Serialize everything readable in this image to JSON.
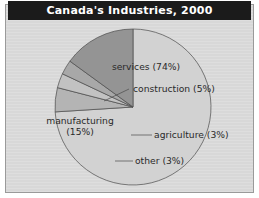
{
  "figure": {
    "title": "Canada's Industries, 2000",
    "background_color": "#d8d8d8",
    "frame_color": "#9a9a9a",
    "title_bar_color": "#1b1b1b",
    "title_text_color": "#ffffff"
  },
  "chart_data": {
    "type": "pie",
    "title": "Canada's Industries, 2000",
    "xlabel": "",
    "ylabel": "",
    "legend": "none",
    "grid": false,
    "start_angle_deg": 90,
    "direction": "counterclockwise",
    "center": {
      "x": 133,
      "y": 107
    },
    "radius": 78,
    "categories": [
      "services",
      "construction",
      "agriculture",
      "other",
      "manufacturing"
    ],
    "values": [
      74,
      5,
      3,
      3,
      15
    ],
    "labels": [
      "services (74%)",
      "construction (5%)",
      "agriculture (3%)",
      "other (3%)",
      "manufacturing (15%)"
    ],
    "slices": [
      {
        "name": "services",
        "label": "services (74%)",
        "value": 74,
        "color": "#d2d2d2",
        "label_placement": "inside",
        "label_x": 146,
        "label_y": 70
      },
      {
        "name": "construction",
        "label": "construction (5%)",
        "value": 5,
        "color": "#b4b4b4",
        "label_placement": "outside",
        "label_x": 133,
        "label_y": 92,
        "leader": {
          "x1": 104,
          "y1": 101,
          "x2": 129,
          "y2": 89
        }
      },
      {
        "name": "agriculture",
        "label": "agriculture (3%)",
        "value": 3,
        "color": "#c2c2c2",
        "label_placement": "outside",
        "label_x": 154,
        "label_y": 138,
        "leader": {
          "x1": 131,
          "y1": 135,
          "x2": 152,
          "y2": 135
        }
      },
      {
        "name": "other",
        "label": "other (3%)",
        "value": 3,
        "color": "#a8a8a8",
        "label_placement": "outside",
        "label_x": 135,
        "label_y": 164,
        "leader": {
          "x1": 115,
          "y1": 161,
          "x2": 133,
          "y2": 161
        }
      },
      {
        "name": "manufacturing",
        "label_line1": "manufacturing",
        "label_line2": "(15%)",
        "label": "manufacturing (15%)",
        "value": 15,
        "color": "#949494",
        "label_placement": "inside",
        "label_x": 80,
        "label_y": 124
      }
    ]
  }
}
